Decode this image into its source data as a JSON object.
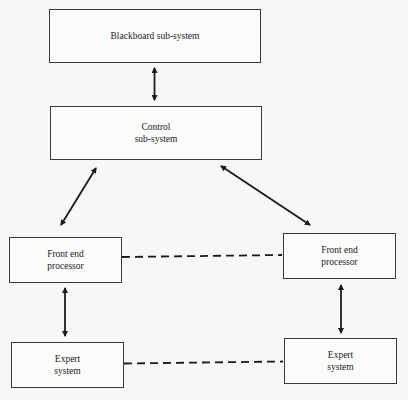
{
  "diagram": {
    "type": "block-diagram",
    "nodes": [
      {
        "id": "blackboard",
        "label": "Blackboard sub-system"
      },
      {
        "id": "control",
        "label": "Control\nsub-system"
      },
      {
        "id": "fep_left",
        "label": "Front end\nprocessor"
      },
      {
        "id": "fep_right",
        "label": "Front end\nprocessor"
      },
      {
        "id": "expert_left",
        "label": "Expert\nsystem"
      },
      {
        "id": "expert_right",
        "label": "Expert\nsystem"
      }
    ],
    "edges": [
      {
        "from": "blackboard",
        "to": "control",
        "style": "solid",
        "arrows": "both"
      },
      {
        "from": "control",
        "to": "fep_left",
        "style": "solid",
        "arrows": "both"
      },
      {
        "from": "control",
        "to": "fep_right",
        "style": "solid",
        "arrows": "both"
      },
      {
        "from": "fep_left",
        "to": "expert_left",
        "style": "solid",
        "arrows": "both"
      },
      {
        "from": "fep_right",
        "to": "expert_right",
        "style": "solid",
        "arrows": "both"
      },
      {
        "from": "fep_left",
        "to": "fep_right",
        "style": "dashed",
        "arrows": "none"
      },
      {
        "from": "expert_left",
        "to": "expert_right",
        "style": "dashed",
        "arrows": "none"
      }
    ]
  }
}
